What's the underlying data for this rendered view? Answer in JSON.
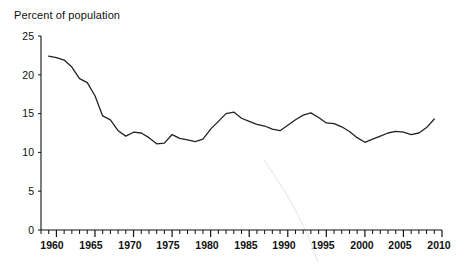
{
  "chart_data": {
    "type": "line",
    "title": "Percent of population",
    "xlabel": "",
    "ylabel": "Percent of population",
    "ylim": [
      0,
      25
    ],
    "xlim": [
      1958,
      2010
    ],
    "grid": false,
    "legend": false,
    "y_ticks": [
      0,
      5,
      10,
      15,
      20,
      25
    ],
    "x_ticks_major": [
      1960,
      1965,
      1970,
      1975,
      1980,
      1985,
      1990,
      1995,
      2000,
      2005,
      2010
    ],
    "x_tick_minor_interval": 1,
    "line_color": "#222222",
    "series": [
      {
        "name": "Percent of population",
        "x": [
          1959,
          1960,
          1961,
          1962,
          1963,
          1964,
          1965,
          1966,
          1967,
          1968,
          1969,
          1970,
          1971,
          1972,
          1973,
          1974,
          1975,
          1976,
          1977,
          1978,
          1979,
          1980,
          1981,
          1982,
          1983,
          1984,
          1985,
          1986,
          1987,
          1988,
          1989,
          1990,
          1991,
          1992,
          1993,
          1994,
          1995,
          1996,
          1997,
          1998,
          1999,
          2000,
          2001,
          2002,
          2003,
          2004,
          2005,
          2006,
          2007,
          2008,
          2009
        ],
        "values": [
          22.4,
          22.2,
          21.9,
          21.0,
          19.5,
          19.0,
          17.3,
          14.7,
          14.2,
          12.8,
          12.1,
          12.6,
          12.5,
          11.9,
          11.1,
          11.2,
          12.3,
          11.8,
          11.6,
          11.4,
          11.7,
          13.0,
          14.0,
          15.0,
          15.2,
          14.4,
          14.0,
          13.6,
          13.4,
          13.0,
          12.8,
          13.5,
          14.2,
          14.8,
          15.1,
          14.5,
          13.8,
          13.7,
          13.3,
          12.7,
          11.9,
          11.3,
          11.7,
          12.1,
          12.5,
          12.7,
          12.6,
          12.3,
          12.5,
          13.2,
          14.3
        ]
      }
    ]
  },
  "axis": {
    "y_labels": [
      "25",
      "20",
      "15",
      "10",
      "5",
      "0"
    ],
    "x_labels": [
      "1960",
      "1965",
      "1970",
      "1975",
      "1980",
      "1985",
      "1990",
      "1995",
      "2000",
      "2005",
      "2010"
    ]
  }
}
